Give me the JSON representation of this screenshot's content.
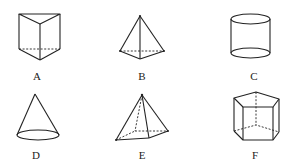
{
  "figure": {
    "title": "",
    "shapes": [
      {
        "id": "A",
        "label": "A",
        "name": "triangular prism"
      },
      {
        "id": "B",
        "label": "B",
        "name": "triangular pyramid"
      },
      {
        "id": "C",
        "label": "C",
        "name": "cylinder"
      },
      {
        "id": "D",
        "label": "D",
        "name": "cone"
      },
      {
        "id": "E",
        "label": "E",
        "name": "quadrangular pyramid"
      },
      {
        "id": "F",
        "label": "F",
        "name": "pentagonal prism"
      }
    ]
  },
  "colors": {
    "stroke": "#222222",
    "background": "#ffffff"
  }
}
